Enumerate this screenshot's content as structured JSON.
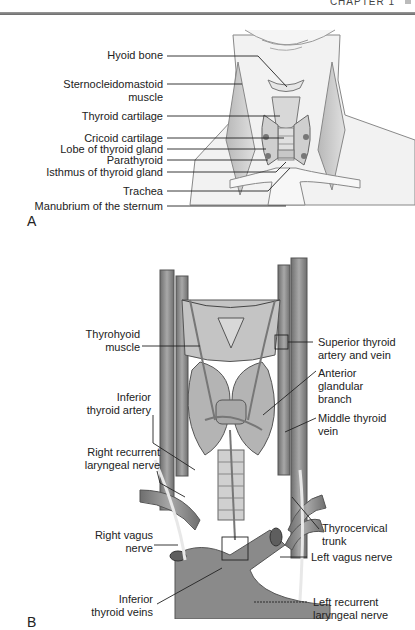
{
  "header": {
    "chapter": "CHAPTER 1"
  },
  "panel_a": {
    "letter": "A",
    "labels": [
      {
        "id": "hyoid-bone",
        "text": "Hyoid bone"
      },
      {
        "id": "sternocleidomastoid",
        "text": "Sternocleidomastoid\nmuscle"
      },
      {
        "id": "thyroid-cartilage",
        "text": "Thyroid cartilage"
      },
      {
        "id": "cricoid-cartilage",
        "text": "Cricoid cartilage"
      },
      {
        "id": "lobe-thyroid",
        "text": "Lobe of thyroid gland"
      },
      {
        "id": "parathyroid",
        "text": "Parathyroid"
      },
      {
        "id": "isthmus",
        "text": "Isthmus of thyroid gland"
      },
      {
        "id": "trachea",
        "text": "Trachea"
      },
      {
        "id": "manubrium",
        "text": "Manubrium of the sternum"
      }
    ]
  },
  "panel_b": {
    "letter": "B",
    "labels_left": [
      {
        "id": "thyrohyoid",
        "text": "Thyrohyoid\nmuscle"
      },
      {
        "id": "inferior-thyroid-artery",
        "text": "Inferior\nthyroid artery"
      },
      {
        "id": "right-recurrent",
        "text": "Right recurrent\nlaryngeal nerve"
      },
      {
        "id": "right-vagus",
        "text": "Right vagus\nnerve"
      },
      {
        "id": "inferior-thyroid-veins",
        "text": "Inferior\nthyroid veins"
      }
    ],
    "labels_right": [
      {
        "id": "superior-thyroid",
        "text": "Superior thyroid\nartery and vein"
      },
      {
        "id": "anterior-glandular",
        "text": "Anterior\nglandular\nbranch"
      },
      {
        "id": "middle-thyroid-vein",
        "text": "Middle thyroid\nvein"
      },
      {
        "id": "thyrocervical",
        "text": "Thyrocervical\ntrunk"
      },
      {
        "id": "left-vagus",
        "text": "Left vagus nerve"
      },
      {
        "id": "left-recurrent",
        "text": "Left recurrent\nlaryngeal nerve"
      }
    ]
  }
}
